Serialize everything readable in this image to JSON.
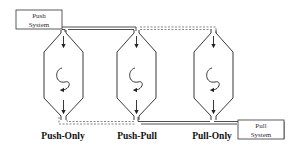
{
  "boxes": {
    "push_system": {
      "line1": "Push",
      "line2": "System"
    },
    "pull_system": {
      "line1": "Pull",
      "line2": "System"
    }
  },
  "columns": [
    {
      "label": "Push-Only"
    },
    {
      "label": "Push-Pull"
    },
    {
      "label": "Pull-Only"
    }
  ],
  "colors": {
    "stroke": "#222222",
    "dashed": "#555555"
  }
}
